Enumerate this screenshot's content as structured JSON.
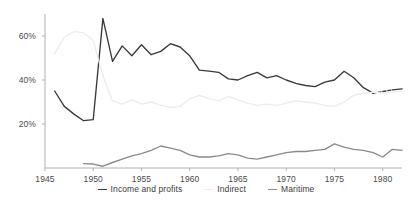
{
  "chart_data": {
    "type": "line",
    "title": "",
    "subtitle": "",
    "xlabel": "",
    "ylabel": "",
    "xlim": [
      1945,
      1982
    ],
    "ylim": [
      0,
      70
    ],
    "grid": false,
    "legend_position": "bottom",
    "x_ticks": [
      "1945",
      "1950",
      "1955",
      "1960",
      "1965",
      "1970",
      "1975",
      "1980"
    ],
    "x_tick_values": [
      1945,
      1950,
      1955,
      1960,
      1965,
      1970,
      1975,
      1980
    ],
    "y_ticks": [
      "20%",
      "40%",
      "60%"
    ],
    "y_tick_values": [
      20,
      40,
      60
    ],
    "series": [
      {
        "name": "Income and profits",
        "color": "#3a3a3a",
        "x": [
          1946,
          1947,
          1948,
          1949,
          1950,
          1951,
          1952,
          1953,
          1954,
          1955,
          1956,
          1957,
          1958,
          1959,
          1960,
          1961,
          1962,
          1963,
          1964,
          1965,
          1966,
          1967,
          1968,
          1969,
          1970,
          1971,
          1972,
          1973,
          1974,
          1975,
          1976,
          1977,
          1978,
          1979,
          1981,
          1982
        ],
        "values": [
          35.0,
          28.0,
          24.5,
          21.5,
          22.0,
          68.0,
          48.5,
          55.5,
          51.0,
          56.0,
          51.5,
          53.0,
          56.5,
          55.0,
          51.0,
          44.5,
          44.0,
          43.5,
          40.5,
          40.0,
          42.0,
          43.5,
          41.0,
          42.0,
          40.0,
          38.5,
          37.5,
          37.0,
          39.0,
          40.0,
          44.0,
          41.0,
          36.5,
          34.0,
          35.5,
          36.0
        ]
      },
      {
        "name": "Indirect",
        "color": "#ececec",
        "x": [
          1946,
          1947,
          1948,
          1949,
          1950,
          1951,
          1952,
          1953,
          1954,
          1955,
          1956,
          1957,
          1958,
          1959,
          1960,
          1961,
          1962,
          1963,
          1964,
          1965,
          1966,
          1967,
          1968,
          1969,
          1970,
          1971,
          1972,
          1973,
          1974,
          1975,
          1976,
          1977,
          1978,
          1979,
          1980,
          1981,
          1982
        ],
        "values": [
          52.0,
          59.5,
          62.0,
          61.5,
          58.0,
          42.0,
          30.5,
          29.0,
          31.0,
          29.0,
          30.0,
          28.5,
          27.5,
          28.0,
          31.5,
          33.0,
          31.5,
          30.5,
          32.5,
          31.0,
          29.5,
          28.5,
          29.0,
          28.5,
          29.5,
          30.5,
          30.0,
          29.5,
          28.5,
          28.0,
          30.0,
          33.0,
          34.0,
          34.5,
          34.0,
          34.5,
          35.0
        ]
      },
      {
        "name": "Maritime",
        "color": "#8b8b8b",
        "x": [
          1949,
          1950,
          1951,
          1952,
          1953,
          1954,
          1955,
          1956,
          1957,
          1958,
          1959,
          1960,
          1961,
          1962,
          1963,
          1964,
          1965,
          1966,
          1967,
          1968,
          1969,
          1970,
          1971,
          1972,
          1973,
          1974,
          1975,
          1976,
          1977,
          1978,
          1979,
          1980,
          1981,
          1982
        ],
        "values": [
          2.0,
          1.8,
          0.8,
          2.5,
          4.0,
          5.5,
          6.5,
          8.0,
          10.0,
          9.0,
          8.0,
          6.0,
          5.0,
          5.0,
          5.5,
          6.5,
          6.0,
          4.5,
          4.0,
          5.0,
          6.0,
          7.0,
          7.5,
          7.5,
          8.0,
          8.5,
          11.0,
          9.5,
          8.5,
          8.0,
          7.0,
          5.0,
          8.5,
          8.0
        ]
      }
    ]
  },
  "legend": {
    "items": [
      {
        "label": "Income and profits",
        "marker": "line-dash",
        "color": "#3a3a3a"
      },
      {
        "label": "Indirect",
        "marker": "line-dash",
        "color": "#ececec"
      },
      {
        "label": "Maritime",
        "marker": "line-dash",
        "color": "#8b8b8b"
      }
    ]
  },
  "axis": {
    "axis_color": "#b0b0b0",
    "tick_text_color": "#4a4a4a"
  }
}
